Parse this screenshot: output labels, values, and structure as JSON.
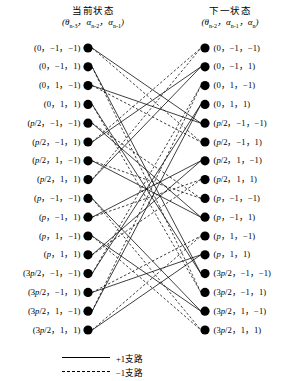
{
  "diagram": {
    "type": "trellis",
    "node_count_per_column": 16,
    "left_column": {
      "heading": "当前状态",
      "tuple_theta": "θ",
      "tuple_theta_sub": "n-3",
      "tuple_a1": "α",
      "tuple_a1_sub": "n-2",
      "tuple_a2": "α",
      "tuple_a2_sub": "n-1",
      "tuple_text": "(θn-3, αn-2, αn-1)",
      "labels": [
        "(0，−1，−1)",
        "(0，−1，1)",
        "(0，1，−1)",
        "(0，1，1)",
        "(p/2，−1，−1)",
        "(p/2，−1，1)",
        "(p/2，1，−1)",
        "(p/2，1，1)",
        "(p，−1，−1)",
        "(p，−1，1)",
        "(p，1，−1)",
        "(p，1，1)",
        "(3p/2，−1，−1)",
        "(3p/2，−1，1)",
        "(3p/2，1，−1)",
        "(3p/2，1，1)"
      ]
    },
    "right_column": {
      "heading": "下一状态",
      "tuple_theta": "θ",
      "tuple_theta_sub": "n-2",
      "tuple_a1": "α",
      "tuple_a1_sub": "n-1",
      "tuple_a2": "α",
      "tuple_a2_sub": "n",
      "tuple_text": "(θn-2, αn-1, αn)",
      "labels": [
        "(0，−1，−1)",
        "(0，−1，1)",
        "(0，1，−1)",
        "(0，1，1)",
        "(p/2，−1，−1)",
        "(p/2，−1，1)",
        "(p/2，1，−1)",
        "(p/2，1，1)",
        "(p，−1，−1)",
        "(p，−1，1)",
        "(p，1，−1)",
        "(p，1，1)",
        "(3p/2，−1，−1)",
        "(3p/2，−1，1)",
        "(3p/2，1，−1)",
        "(3p/2，1，1)"
      ]
    },
    "legend": {
      "solid_label": "+1支路",
      "dashed_label": "−1支路",
      "solid_style": "solid",
      "dashed_style": "dashed",
      "color": "#000000"
    },
    "geometry": {
      "left_node_x": 88,
      "right_node_x": 205,
      "first_node_y": 48,
      "node_spacing": 18.8,
      "node_radius": 4.6,
      "node_color": "#000000"
    },
    "edges_solid": [
      [
        0,
        4
      ],
      [
        1,
        12
      ],
      [
        2,
        4
      ],
      [
        3,
        12
      ],
      [
        4,
        9
      ],
      [
        5,
        1
      ],
      [
        6,
        9
      ],
      [
        7,
        1
      ],
      [
        8,
        14
      ],
      [
        9,
        6
      ],
      [
        10,
        14
      ],
      [
        11,
        6
      ],
      [
        12,
        3
      ],
      [
        13,
        11
      ],
      [
        14,
        3
      ],
      [
        15,
        11
      ]
    ],
    "edges_dashed": [
      [
        0,
        5
      ],
      [
        1,
        13
      ],
      [
        2,
        5
      ],
      [
        3,
        13
      ],
      [
        4,
        8
      ],
      [
        5,
        0
      ],
      [
        6,
        8
      ],
      [
        7,
        0
      ],
      [
        8,
        15
      ],
      [
        9,
        7
      ],
      [
        10,
        15
      ],
      [
        11,
        7
      ],
      [
        12,
        2
      ],
      [
        13,
        10
      ],
      [
        14,
        2
      ],
      [
        15,
        10
      ]
    ]
  }
}
